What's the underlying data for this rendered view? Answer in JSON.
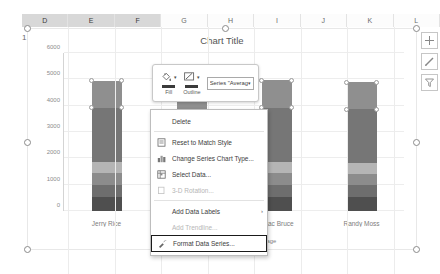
{
  "spreadsheet": {
    "column_headers": [
      "D",
      "E",
      "F",
      "G",
      "H",
      "I",
      "J",
      "K",
      "L"
    ],
    "selected_columns": [
      "D",
      "E",
      "F"
    ],
    "row_header": "1"
  },
  "chart": {
    "title": "Chart Title",
    "side_buttons": [
      {
        "name": "chart-elements-button",
        "icon": "plus-icon"
      },
      {
        "name": "chart-styles-button",
        "icon": "brush-icon"
      },
      {
        "name": "chart-filters-button",
        "icon": "funnel-icon"
      }
    ]
  },
  "chart_data": {
    "type": "bar",
    "title": "Chart Title",
    "xlabel": "",
    "ylabel": "",
    "ylim": [
      0,
      6000
    ],
    "yticks": [
      0,
      1000,
      2000,
      3000,
      4000,
      5000,
      6000
    ],
    "grid": true,
    "stacked": true,
    "legend_position": "bottom",
    "categories": [
      "Jerry Rice",
      "Larry Fit",
      "Isaac Bruce",
      "Randy Moss"
    ],
    "series": [
      {
        "name": "0-500",
        "color": "#4f4f4f",
        "values": [
          520,
          500,
          520,
          520
        ]
      },
      {
        "name": "500",
        "color": "#6e6e6e",
        "values": [
          480,
          470,
          480,
          470
        ]
      },
      {
        "name": "Best",
        "color": "#8c8c8c",
        "values": [
          430,
          420,
          430,
          420
        ]
      },
      {
        "name": "Average",
        "color": "#b5b5b5",
        "values": [
          430,
          420,
          430,
          420
        ]
      },
      {
        "name": "series5",
        "color": "#767676",
        "values": [
          2070,
          1920,
          2060,
          2030
        ]
      },
      {
        "name": "series6",
        "color": "#8f8f8f",
        "values": [
          1010,
          830,
          1050,
          1030
        ]
      }
    ],
    "legend": [
      {
        "label": "0-500",
        "color": "#4f4f4f"
      },
      {
        "label": "500",
        "color": "#6e6e6e"
      },
      {
        "label": "Best",
        "color": "#8c8c8c"
      },
      {
        "label": "Average",
        "color": "#b5b5b5"
      }
    ]
  },
  "mini_toolbar": {
    "fill": {
      "label": "Fill",
      "icon": "fill-bucket-icon"
    },
    "outline": {
      "label": "Outline",
      "icon": "pencil-outline-icon"
    },
    "series_select": {
      "value": "Series \"Averag",
      "caret": "▾"
    }
  },
  "context_menu": {
    "items": [
      {
        "label": "Delete",
        "icon": "",
        "disabled": false,
        "submenu": false,
        "highlighted": false
      },
      {
        "label": "Reset to Match Style",
        "icon": "reset-style-icon",
        "disabled": false,
        "submenu": false,
        "highlighted": false
      },
      {
        "label": "Change Series Chart Type...",
        "icon": "chart-type-icon",
        "disabled": false,
        "submenu": false,
        "highlighted": false
      },
      {
        "label": "Select Data...",
        "icon": "select-data-icon",
        "disabled": false,
        "submenu": false,
        "highlighted": false
      },
      {
        "label": "3-D Rotation...",
        "icon": "rotation-icon",
        "disabled": true,
        "submenu": false,
        "highlighted": false
      },
      {
        "label": "Add Data Labels",
        "icon": "",
        "disabled": false,
        "submenu": true,
        "highlighted": false
      },
      {
        "label": "Add Trendline...",
        "icon": "",
        "disabled": true,
        "submenu": false,
        "highlighted": false
      },
      {
        "label": "Format Data Series...",
        "icon": "format-series-icon",
        "disabled": false,
        "submenu": false,
        "highlighted": true
      }
    ],
    "submenu_arrow": "›"
  }
}
